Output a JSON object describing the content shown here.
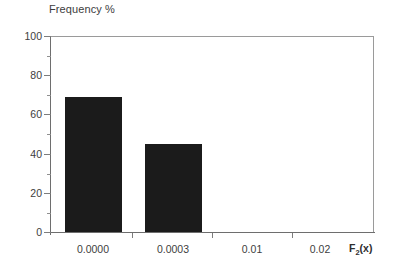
{
  "chart_data": {
    "type": "bar",
    "title": "Frequency %",
    "xlabel": "F2(x)",
    "xlabel_base": "F",
    "xlabel_sub": "2",
    "xlabel_tail": "(x)",
    "ylabel": "",
    "categories": [
      "0.0000",
      "0.0003",
      "0.01",
      "0.02"
    ],
    "values": [
      69,
      45,
      0,
      0
    ],
    "ylim": [
      0,
      100
    ],
    "yticks": [
      0,
      20,
      40,
      60,
      80,
      100
    ],
    "ytick_labels": [
      "0",
      "20",
      "40",
      "60",
      "80",
      "100"
    ],
    "yminor_ticks": [
      10,
      30,
      50,
      70,
      90
    ],
    "xtick_labels": [
      "0.0000",
      "0.0003",
      "0.01",
      "0.02"
    ],
    "grid": false,
    "legend": null,
    "bar_color": "#1b1b1b",
    "frame_color": "#9a9a9a",
    "axis_color": "#6e6e6e",
    "background": "#ffffff"
  },
  "chart": {
    "title": "Frequency %",
    "bars": [
      {
        "label": "0.0000",
        "value": 69
      },
      {
        "label": "0.0003",
        "value": 45
      },
      {
        "label": "0.01",
        "value": 0
      },
      {
        "label": "0.02",
        "value": 0
      }
    ],
    "y_axis": {
      "labels": [
        "100",
        "80",
        "60",
        "40",
        "20",
        "0"
      ]
    },
    "x_axis": {
      "labels": [
        "0.0000",
        "0.0003",
        "0.01",
        "0.02"
      ],
      "title_base": "F",
      "title_sub": "2",
      "title_tail": "(x)"
    }
  }
}
